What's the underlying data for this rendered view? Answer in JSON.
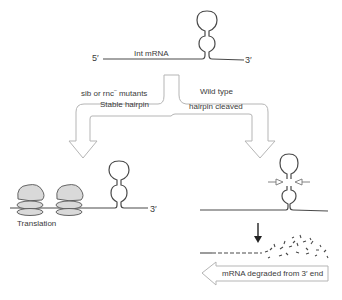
{
  "top": {
    "five_prime": "5′",
    "three_prime": "3′",
    "mrna_label": "Int mRNA"
  },
  "branch_left": {
    "condition_main": "sib or rnc",
    "condition_sup": "–",
    "condition_tail": " mutants",
    "result": "Stable hairpin"
  },
  "branch_right": {
    "condition": "Wild type",
    "result": "hairpin cleaved"
  },
  "left_outcome": {
    "three_prime": "3′",
    "label": "Translation"
  },
  "right_outcome": {
    "degradation_label": "mRNA degraded from 3′ end"
  },
  "colors": {
    "line": "#4a4a4a",
    "arrow_outline": "#b5b5b5",
    "ribosome_fill": "#d9d9d9"
  }
}
